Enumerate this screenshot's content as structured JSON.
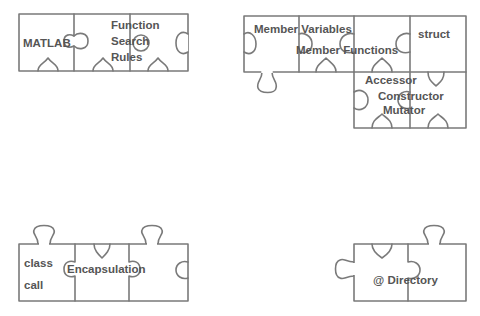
{
  "colors": {
    "outline": "#7a7a7a",
    "text": "#555555",
    "background": "#ffffff"
  },
  "groups": [
    {
      "id": "function-search",
      "pieces": [
        "matlab",
        "function-search-rules",
        "blank"
      ],
      "labels": {
        "matlab": "MATLAB",
        "function_1": "Function",
        "function_2": "Search",
        "function_3": "Rules"
      }
    },
    {
      "id": "members",
      "labels": {
        "member_variables": "Member Variables",
        "member_functions": "Member Functions",
        "struct": "struct",
        "accessor": "Accessor",
        "constructor": "Constructor",
        "mutator": "Mutator"
      }
    },
    {
      "id": "encapsulation",
      "labels": {
        "class": "class",
        "call": "call",
        "encapsulation": "Encapsulation"
      }
    },
    {
      "id": "directory",
      "labels": {
        "directory": "@ Directory"
      }
    }
  ]
}
